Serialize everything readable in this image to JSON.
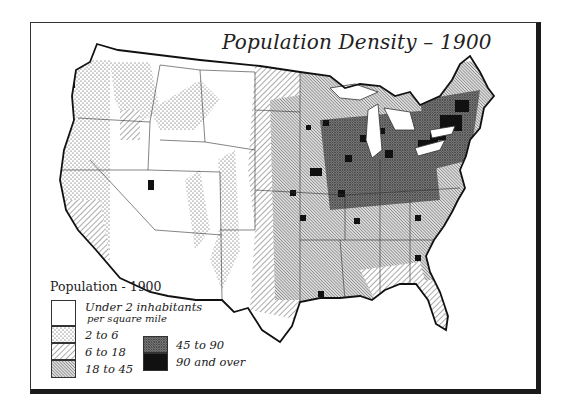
{
  "map": {
    "title": "Population Density – 1900",
    "region": "United States",
    "year": "1900"
  },
  "legend": {
    "title": "Population - 1900",
    "items": [
      {
        "label": "Under 2 inhabitants",
        "sublabel": "per square mile",
        "pattern": "blank",
        "color": "#ffffff"
      },
      {
        "label": "2 to 6",
        "pattern": "dots",
        "color": "#f2f2f2"
      },
      {
        "label": "6 to 18",
        "pattern": "wide-diagonal-hatch",
        "color": "#d8d8d8"
      },
      {
        "label": "18 to 45",
        "pattern": "dense-diagonal-hatch",
        "color": "#b8b8b8"
      },
      {
        "label": "45 to 90",
        "pattern": "crosshatch",
        "color": "#7a7a7a"
      },
      {
        "label": "90 and over",
        "pattern": "solid",
        "color": "#111111"
      }
    ]
  },
  "colors": {
    "ink": "#1a1a1a",
    "paper": "#ffffff"
  }
}
